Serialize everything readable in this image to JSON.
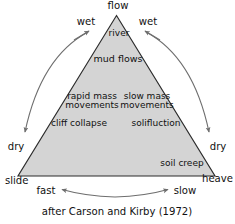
{
  "figure": {
    "type": "ternary-diagram",
    "caption": "after Carson and Kirby (1972)",
    "colors": {
      "triangle_fill": "#d4d4d4",
      "triangle_stroke": "#2b2b2b",
      "arrow_stroke": "#6e6e6e",
      "text": "#111111",
      "background": "#ffffff"
    }
  },
  "apex": {
    "top_label": "flow",
    "bottom_left_label": "slide",
    "bottom_right_label": "heave"
  },
  "axis_labels": {
    "wet_left": "wet",
    "wet_right": "wet",
    "dry_left": "dry",
    "dry_right": "dry",
    "fast": "fast",
    "slow": "slow"
  },
  "inside_labels": [
    {
      "name": "river",
      "text": "river"
    },
    {
      "name": "mud-flows",
      "text": "mud flows"
    },
    {
      "name": "rapid-mass-movements",
      "line1": "rapid mass",
      "line2": "movements"
    },
    {
      "name": "slow-mass-movements",
      "line1": "slow mass",
      "line2": "movements"
    },
    {
      "name": "cliff-collapse",
      "text": "cliff collapse"
    },
    {
      "name": "solifluction",
      "text": "solifluction"
    },
    {
      "name": "soil-creep",
      "text": "soil creep"
    }
  ]
}
